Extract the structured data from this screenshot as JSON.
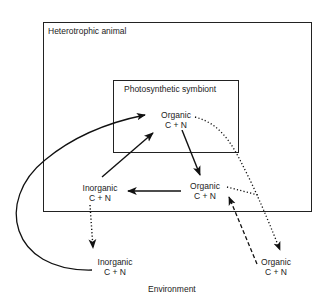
{
  "diagram": {
    "outer_box_label": "Heterotrophic animal",
    "inner_box_label": "Photosynthetic symbiont",
    "environment_label": "Environment",
    "nodes": {
      "symbiont_organic": {
        "line1": "Organic",
        "line2": "C + N"
      },
      "animal_inorganic": {
        "line1": "Inorganic",
        "line2": "C + N"
      },
      "animal_organic": {
        "line1": "Organic",
        "line2": "C + N"
      },
      "env_inorganic": {
        "line1": "Inorganic",
        "line2": "C + N"
      },
      "env_organic": {
        "line1": "Organic",
        "line2": "C + N"
      }
    },
    "edges": [
      {
        "from": "animal_inorganic",
        "to": "symbiont_organic",
        "style": "solid"
      },
      {
        "from": "symbiont_organic",
        "to": "animal_organic",
        "style": "solid"
      },
      {
        "from": "animal_organic",
        "to": "animal_inorganic",
        "style": "solid"
      },
      {
        "from": "env_inorganic",
        "to": "symbiont_organic",
        "style": "solid-curved"
      },
      {
        "from": "animal_inorganic",
        "to": "env_inorganic",
        "style": "dotted"
      },
      {
        "from": "symbiont_organic",
        "to": "env_organic",
        "style": "dotted"
      },
      {
        "from": "animal_organic",
        "to": "env_organic",
        "style": "dotted"
      },
      {
        "from": "env_organic",
        "to": "animal_organic",
        "style": "dashed"
      }
    ]
  }
}
